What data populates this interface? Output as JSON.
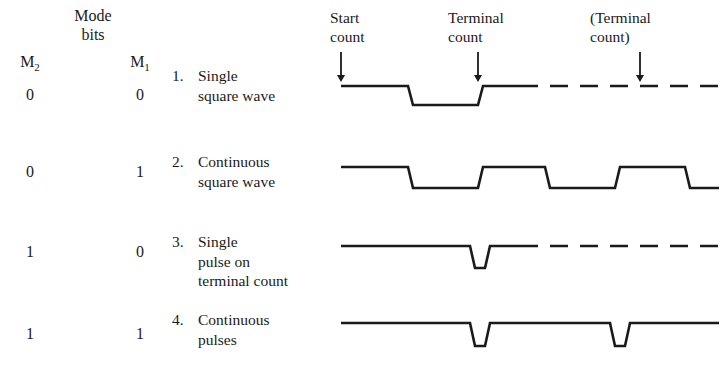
{
  "figure": {
    "mode_header": {
      "line1": "Mode",
      "line2": "bits"
    },
    "columns": [
      {
        "label": "M",
        "subscript": "2"
      },
      {
        "label": "M",
        "subscript": "1"
      }
    ],
    "annotations": [
      {
        "id": "start-count",
        "line1": "Start",
        "line2": "count",
        "x": 330,
        "y": 8,
        "arrow_x": 341,
        "arrow_top": 52,
        "arrow_bottom": 82
      },
      {
        "id": "terminal-count",
        "line1": "Terminal",
        "line2": "count",
        "x": 448,
        "y": 8,
        "arrow_x": 478,
        "arrow_top": 52,
        "arrow_bottom": 82
      },
      {
        "id": "terminal-count-alt",
        "line1": "(Terminal",
        "line2": "count)",
        "x": 590,
        "y": 8,
        "arrow_x": 640,
        "arrow_top": 52,
        "arrow_bottom": 82
      }
    ],
    "rows": [
      {
        "id": "mode-single-square-wave",
        "m2": "0",
        "m1": "0",
        "number": "1.",
        "lines": [
          "Single",
          "square wave"
        ],
        "desc_top": 66,
        "bits_top": 86,
        "waveform": {
          "type": "single-square-wave",
          "high_y": 86,
          "low_y": 105,
          "start_x": 341,
          "fall_x": 408,
          "rise_x": 478,
          "solid_end_x": 520,
          "dash_end_x": 719,
          "dash": "18 12"
        }
      },
      {
        "id": "mode-continuous-square-wave",
        "m2": "0",
        "m1": "1",
        "number": "2.",
        "lines": [
          "Continuous",
          "square wave"
        ],
        "desc_top": 152,
        "bits_top": 163,
        "waveform": {
          "type": "continuous-square-wave",
          "high_y": 167,
          "low_y": 188,
          "start_x": 341,
          "edges": [
            408,
            478,
            545,
            615,
            685
          ],
          "end_x": 719
        }
      },
      {
        "id": "mode-single-pulse-terminal-count",
        "m2": "1",
        "m1": "0",
        "number": "3.",
        "lines": [
          "Single",
          "pulse on",
          "terminal count"
        ],
        "desc_top": 232,
        "bits_top": 243,
        "waveform": {
          "type": "single-pulse",
          "high_y": 246,
          "low_y": 268,
          "start_x": 341,
          "pulse_start_x": 470,
          "pulse_end_x": 485,
          "solid_end_x": 520,
          "dash_end_x": 719,
          "dash": "18 12"
        }
      },
      {
        "id": "mode-continuous-pulses",
        "m2": "1",
        "m1": "1",
        "number": "4.",
        "lines": [
          "Continuous",
          "pulses"
        ],
        "desc_top": 310,
        "bits_top": 325,
        "waveform": {
          "type": "continuous-pulses",
          "high_y": 323,
          "low_y": 346,
          "start_x": 341,
          "pulses": [
            [
              470,
              485
            ],
            [
              610,
              625
            ]
          ],
          "end_x": 719
        }
      }
    ],
    "style": {
      "line_color": "#1a1a1a",
      "line_width": 2.6,
      "background": "#ffffff"
    }
  }
}
